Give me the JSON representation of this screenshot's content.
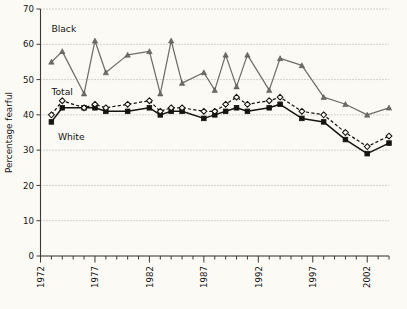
{
  "chart_data": {
    "type": "line",
    "title": "",
    "xlabel": "",
    "ylabel": "Percentage fearful",
    "xlim": [
      1972,
      2004
    ],
    "ylim": [
      0,
      70
    ],
    "yticks": [
      0,
      10,
      20,
      30,
      40,
      50,
      60,
      70
    ],
    "xticks": [
      1972,
      1977,
      1982,
      1987,
      1992,
      1997,
      2002
    ],
    "xtick_labels": [
      "1972",
      "1977",
      "1982",
      "1987",
      "1992",
      "1997",
      "2002"
    ],
    "ytick_labels": [
      "0",
      "10",
      "20",
      "30",
      "40",
      "50",
      "60",
      "70"
    ],
    "grid": true,
    "grid_axis": "y",
    "legend": "inline-annotations",
    "annotations": [
      {
        "text": "Black",
        "x": 1973.0,
        "y": 63.5
      },
      {
        "text": "Total",
        "x": 1973.0,
        "y": 45.5
      },
      {
        "text": "White",
        "x": 1973.6,
        "y": 33.0
      }
    ],
    "x": [
      1973,
      1974,
      1976,
      1977,
      1978,
      1980,
      1982,
      1983,
      1984,
      1985,
      1987,
      1988,
      1989,
      1990,
      1991,
      1993,
      1994,
      1996,
      1998,
      2000,
      2002,
      2004
    ],
    "series": [
      {
        "name": "Black",
        "color": "#6e6e68",
        "marker": "triangle",
        "linestyle": "solid",
        "values": [
          55,
          58,
          46,
          61,
          52,
          57,
          58,
          46,
          61,
          49,
          52,
          47,
          57,
          48,
          57,
          47,
          56,
          54,
          45,
          43,
          40,
          42
        ]
      },
      {
        "name": "Total",
        "color": "#15140f",
        "marker": "open-diamond",
        "linestyle": "dashed",
        "values": [
          40,
          44,
          42,
          43,
          42,
          43,
          44,
          41,
          42,
          42,
          41,
          41,
          43,
          45,
          43,
          44,
          45,
          41,
          40,
          35,
          31,
          34
        ]
      },
      {
        "name": "White",
        "color": "#15140f",
        "marker": "filled-square",
        "linestyle": "solid",
        "values": [
          38,
          42,
          42,
          42,
          41,
          41,
          42,
          40,
          41,
          41,
          39,
          40,
          41,
          42,
          41,
          42,
          43,
          39,
          38,
          33,
          29,
          32
        ]
      }
    ]
  },
  "axis": {
    "y_title": "Percentage fearful"
  }
}
